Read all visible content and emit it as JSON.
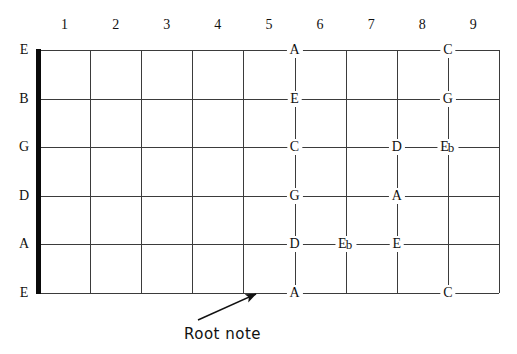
{
  "diagram": {
    "type": "fretboard",
    "fret_numbers": [
      "1",
      "2",
      "3",
      "4",
      "5",
      "6",
      "7",
      "8",
      "9"
    ],
    "string_labels": [
      "E",
      "B",
      "G",
      "D",
      "A",
      "E"
    ],
    "nut_label": "nut",
    "annotation": {
      "label": "Root note",
      "points_to": "A"
    },
    "notes": [
      {
        "string": "E",
        "string_index": 0,
        "fret": 5,
        "label": "A",
        "accidental": "",
        "align": "on-fret"
      },
      {
        "string": "E",
        "string_index": 0,
        "fret": 8,
        "label": "C",
        "accidental": "",
        "align": "on-fret"
      },
      {
        "string": "B",
        "string_index": 1,
        "fret": 5,
        "label": "E",
        "accidental": "",
        "align": "on-fret"
      },
      {
        "string": "B",
        "string_index": 1,
        "fret": 8,
        "label": "G",
        "accidental": "",
        "align": "on-fret"
      },
      {
        "string": "G",
        "string_index": 2,
        "fret": 5,
        "label": "C",
        "accidental": "",
        "align": "on-fret"
      },
      {
        "string": "G",
        "string_index": 2,
        "fret": 7,
        "label": "D",
        "accidental": "",
        "align": "on-fret"
      },
      {
        "string": "G",
        "string_index": 2,
        "fret": 8,
        "label": "E",
        "accidental": "b",
        "align": "on-fret"
      },
      {
        "string": "D",
        "string_index": 3,
        "fret": 5,
        "label": "G",
        "accidental": "",
        "align": "on-fret"
      },
      {
        "string": "D",
        "string_index": 3,
        "fret": 7,
        "label": "A",
        "accidental": "",
        "align": "on-fret"
      },
      {
        "string": "A",
        "string_index": 4,
        "fret": 5,
        "label": "D",
        "accidental": "",
        "align": "on-fret"
      },
      {
        "string": "A",
        "string_index": 4,
        "fret": 6,
        "label": "E",
        "accidental": "b",
        "align": "on-fret"
      },
      {
        "string": "A",
        "string_index": 4,
        "fret": 7,
        "label": "E",
        "accidental": "",
        "align": "on-fret"
      },
      {
        "string": "E2",
        "string_index": 5,
        "fret": 5,
        "label": "A",
        "accidental": "",
        "align": "on-fret"
      },
      {
        "string": "E2",
        "string_index": 5,
        "fret": 8,
        "label": "C",
        "accidental": "",
        "align": "on-fret"
      }
    ],
    "colors": {
      "line": "#3b3b3b",
      "nut": "#0a0a0a",
      "text": "#111111",
      "background": "#ffffff"
    }
  }
}
